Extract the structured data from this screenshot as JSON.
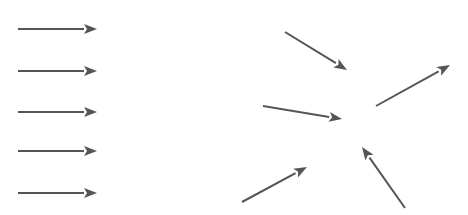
{
  "figure": {
    "width": 468,
    "height": 215,
    "background_color": "#ffffff",
    "stroke_color": "#555555",
    "stroke_color_light": "#6b6b6b",
    "stroke_width": 2.0,
    "arrowhead_length": 13,
    "arrowhead_half_width": 5.0
  },
  "groups": [
    {
      "id": "left-group",
      "label": "uniform-parallel-field",
      "description": "Five identical horizontal arrows pointing right",
      "arrow_count": 5,
      "arrows": [
        {
          "id": "left-arrow-1",
          "label": "horizontal-arrow-row-1",
          "x1": 18,
          "y1": 29,
          "x2": 97,
          "y2": 29
        },
        {
          "id": "left-arrow-2",
          "label": "horizontal-arrow-row-2",
          "x1": 18,
          "y1": 71,
          "x2": 97,
          "y2": 71
        },
        {
          "id": "left-arrow-3",
          "label": "horizontal-arrow-row-3",
          "x1": 18,
          "y1": 112,
          "x2": 97,
          "y2": 112
        },
        {
          "id": "left-arrow-4",
          "label": "horizontal-arrow-row-4",
          "x1": 18,
          "y1": 151,
          "x2": 97,
          "y2": 151
        },
        {
          "id": "left-arrow-5",
          "label": "horizontal-arrow-row-5",
          "x1": 18,
          "y1": 193,
          "x2": 97,
          "y2": 193
        }
      ]
    },
    {
      "id": "right-group",
      "label": "convergent-field",
      "description": "Five arrows converging toward a central point",
      "arrow_count": 5,
      "convergence_point": {
        "x": 350,
        "y": 125
      },
      "arrows": [
        {
          "id": "right-arrow-1",
          "label": "arrow-down-right-top",
          "x1": 285,
          "y1": 32,
          "x2": 347,
          "y2": 70
        },
        {
          "id": "right-arrow-2",
          "label": "arrow-right-middle-left",
          "x1": 263,
          "y1": 106,
          "x2": 342,
          "y2": 119
        },
        {
          "id": "right-arrow-3",
          "label": "arrow-up-right-far",
          "x1": 376,
          "y1": 106,
          "x2": 450,
          "y2": 65
        },
        {
          "id": "right-arrow-4",
          "label": "arrow-up-right-bottom",
          "x1": 242,
          "y1": 202,
          "x2": 307,
          "y2": 167
        },
        {
          "id": "right-arrow-5",
          "label": "arrow-up-left-bottom",
          "x1": 405,
          "y1": 208,
          "x2": 362,
          "y2": 147
        }
      ]
    }
  ]
}
